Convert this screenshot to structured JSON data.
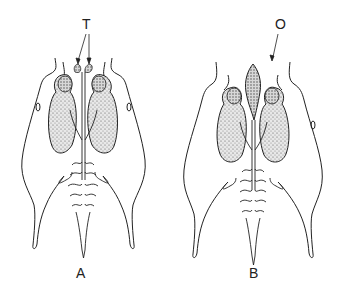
{
  "figure": {
    "panels": [
      {
        "id": "A",
        "label": "A",
        "annotation": {
          "text": "T",
          "arrows": 2,
          "target": "paired organs at anterior end"
        }
      },
      {
        "id": "B",
        "label": "B",
        "annotation": {
          "text": "O",
          "arrows": 1,
          "target": "single elongated median organ at anterior end"
        }
      }
    ],
    "colors": {
      "line": "#222222",
      "stipple": "#555555",
      "background": "#ffffff"
    }
  }
}
